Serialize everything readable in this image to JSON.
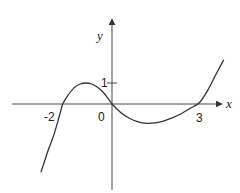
{
  "chart_data": {
    "type": "line",
    "title": "",
    "xlabel": "x",
    "ylabel": "y",
    "x_tick_labels": [
      "-2",
      "0",
      "3"
    ],
    "y_tick_labels": [
      "1"
    ],
    "grid": false,
    "legend": null,
    "xlim": [
      -2.5,
      3.9
    ],
    "ylim": [
      -4.1,
      4.0
    ],
    "annotations": [
      "x-intercepts near -1.7, 0, 3",
      "local maximum ≈ 1 near x ≈ -0.9",
      "local minimum below x-axis near x ≈ 1.3"
    ],
    "series": [
      {
        "name": "y = f(x)",
        "x": [
          -2.45,
          -2.2,
          -2.0,
          -1.8,
          -1.7,
          -1.5,
          -1.3,
          -1.1,
          -0.9,
          -0.7,
          -0.5,
          -0.3,
          -0.1,
          0.0,
          0.3,
          0.6,
          0.9,
          1.2,
          1.5,
          1.8,
          2.1,
          2.4,
          2.7,
          3.0,
          3.3,
          3.6,
          3.85
        ],
        "y": [
          -3.25,
          -2.2,
          -1.45,
          -0.5,
          0.0,
          0.45,
          0.78,
          0.95,
          1.0,
          0.95,
          0.8,
          0.55,
          0.2,
          0.0,
          -0.4,
          -0.68,
          -0.85,
          -0.92,
          -0.9,
          -0.8,
          -0.65,
          -0.45,
          -0.2,
          0.05,
          0.65,
          1.45,
          2.1
        ]
      }
    ]
  },
  "labels": {
    "x_axis": "x",
    "y_axis": "y",
    "tick_neg2": "-2",
    "tick_0": "0",
    "tick_3": "3",
    "tick_1": "1"
  }
}
